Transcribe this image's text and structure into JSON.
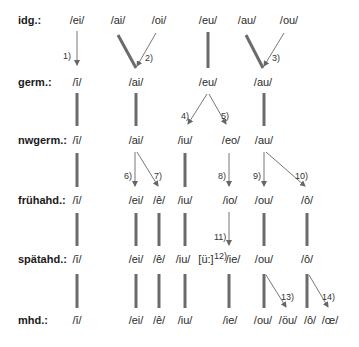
{
  "rows": [
    {
      "label": "idg.:",
      "y": 14
    },
    {
      "label": "germ.:",
      "y": 76
    },
    {
      "label": "nwgerm.:",
      "y": 134
    },
    {
      "label": "frühahd.:",
      "y": 194
    },
    {
      "label": "spätahd.:",
      "y": 253
    },
    {
      "label": "mhd.:",
      "y": 314
    }
  ],
  "phonemes": {
    "idg": [
      {
        "text": "/ei/",
        "x": 77
      },
      {
        "text": "/ai/",
        "x": 116
      },
      {
        "text": "/oi/",
        "x": 157
      },
      {
        "text": "/eu/",
        "x": 208
      },
      {
        "text": "/au/",
        "x": 247
      },
      {
        "text": "/ou/",
        "x": 289
      }
    ],
    "germ": [
      {
        "text": "/ī/",
        "x": 77
      },
      {
        "text": "/ai/",
        "x": 136
      },
      {
        "text": "/eu/",
        "x": 208
      },
      {
        "text": "/au/",
        "x": 263
      }
    ],
    "nwgerm": [
      {
        "text": "/ī/",
        "x": 77
      },
      {
        "text": "/ai/",
        "x": 136
      },
      {
        "text": "/iu/",
        "x": 185
      },
      {
        "text": "/eo/",
        "x": 231
      },
      {
        "text": "/au/",
        "x": 264
      }
    ],
    "fruehahd": [
      {
        "text": "/ī/",
        "x": 77
      },
      {
        "text": "/ei/",
        "x": 136
      },
      {
        "text": "/ê/",
        "x": 159
      },
      {
        "text": "/iu/",
        "x": 185
      },
      {
        "text": "/io/",
        "x": 230
      },
      {
        "text": "/ou/",
        "x": 264
      },
      {
        "text": "/ô/",
        "x": 307
      }
    ],
    "spaetahd": [
      {
        "text": "/ī/",
        "x": 77
      },
      {
        "text": "/ei/",
        "x": 136
      },
      {
        "text": "/ê/",
        "x": 159
      },
      {
        "text": "/iu/",
        "x": 183
      },
      {
        "text": "[ü:]",
        "x": 209
      },
      {
        "text": "/ie/",
        "x": 230
      },
      {
        "text": "/ou/",
        "x": 264
      },
      {
        "text": "/ô/",
        "x": 307
      }
    ],
    "mhd": [
      {
        "text": "/ī/",
        "x": 77
      },
      {
        "text": "/ei/",
        "x": 136
      },
      {
        "text": "/ê/",
        "x": 159
      },
      {
        "text": "/iu/",
        "x": 185
      },
      {
        "text": "/ie/",
        "x": 230
      },
      {
        "text": "/ou/",
        "x": 263
      },
      {
        "text": "/öu/",
        "x": 289
      },
      {
        "text": "/ô/",
        "x": 310
      },
      {
        "text": "/œ/",
        "x": 330
      }
    ]
  },
  "footnote_markers": {
    "n1": "1)",
    "n2": "2)",
    "n3": "3)",
    "n4": "4)",
    "n5": "5)",
    "n6": "6)",
    "n7": "7)",
    "n8": "8)",
    "n9": "9)",
    "n10": "10)",
    "n11": "11)",
    "n12": "12)",
    "n13": "13)",
    "n14": "14)"
  },
  "colors": {
    "thick_line": "#6b6b6b",
    "arrow_line": "#777777",
    "text": "#222222"
  }
}
